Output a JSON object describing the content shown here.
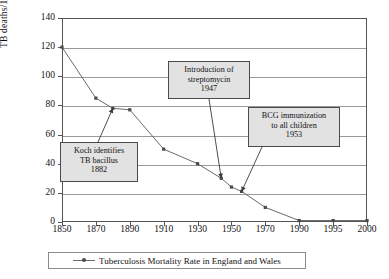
{
  "chart_data": {
    "type": "line",
    "title": "",
    "xlabel": "",
    "ylabel": "TB deaths/100,000",
    "ylim": [
      0,
      140
    ],
    "ytick_step": 20,
    "yticks": [
      0,
      20,
      40,
      60,
      80,
      100,
      120,
      140
    ],
    "categories": [
      "1850",
      "1870",
      "1890",
      "1910",
      "1930",
      "1950",
      "1970",
      "1990",
      "1995",
      "2000"
    ],
    "grid": true,
    "legend_position": "bottom",
    "series": [
      {
        "name": "Tuberculosis Mortality Rate in England and Wales",
        "color": "#6b6b6b",
        "marker_color": "#4a4a4a",
        "x": [
          1850,
          1870,
          1880,
          1890,
          1910,
          1930,
          1944,
          1950,
          1956,
          1970,
          1990,
          1995,
          2000
        ],
        "values": [
          120,
          85,
          78,
          77,
          50,
          40,
          30,
          24,
          21,
          10,
          1,
          1,
          1
        ]
      }
    ],
    "annotations": [
      {
        "name": "koch",
        "lines": [
          "Koch identifies",
          "TB bacillus",
          "1882"
        ],
        "target_year": 1880,
        "target_value": 78
      },
      {
        "name": "streptomycin",
        "lines": [
          "Introduction of",
          "streptomycin",
          "1947"
        ],
        "target_year": 1944,
        "target_value": 30
      },
      {
        "name": "bcg",
        "lines": [
          "BCG immunization",
          "to all children",
          "1953"
        ],
        "target_year": 1956,
        "target_value": 21
      }
    ]
  },
  "legend": {
    "entry_label": "Tuberculosis Mortality Rate in England and Wales"
  },
  "axes": {
    "y_title": "TB deaths/100,000"
  },
  "colors": {
    "line": "#6b6b6b",
    "marker": "#4a4a4a",
    "gridline": "#9a9a9a",
    "axis": "#555555",
    "callout_fill": "#e2e2e2",
    "callout_border": "#4a4a4a",
    "background": "#ffffff"
  }
}
